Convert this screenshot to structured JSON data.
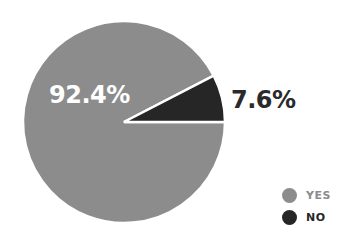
{
  "chart_data": {
    "type": "pie",
    "title": "",
    "categories": [
      "YES",
      "NO"
    ],
    "values": [
      92.4,
      7.6
    ],
    "labels": [
      "92.4%",
      "7.6%"
    ],
    "colors": [
      "#8c8c8c",
      "#262626"
    ],
    "legend_position": "bottom-right",
    "start_angle_deg": 0,
    "direction": "counterclockwise-for-NO-slice"
  },
  "legend": {
    "items": [
      {
        "label": "YES",
        "color": "#8c8c8c",
        "text_color": "#8c8c8c"
      },
      {
        "label": "NO",
        "color": "#262626",
        "text_color": "#262626"
      }
    ]
  },
  "labels": {
    "yes_pct": "92.4%",
    "no_pct": "7.6%"
  }
}
